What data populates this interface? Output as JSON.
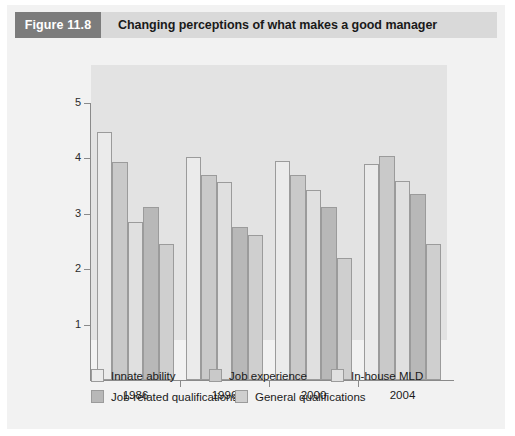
{
  "figure": {
    "number": "Figure 11.8",
    "title": "Changing perceptions of what makes a good manager"
  },
  "colors": {
    "figure_number_bg": "#7c7c7c",
    "figure_title_bg": "#d9d9d9",
    "card_bg": "#f2f2f2",
    "plot_bg": "#e3e3e3",
    "axis": "#8a8a8a",
    "series": [
      "#ebebeb",
      "#c9c9c9",
      "#e0e0e0",
      "#b8b8b8",
      "#cfcfcf"
    ]
  },
  "chart_data": {
    "type": "bar",
    "title": "Changing perceptions of what makes a good manager",
    "xlabel": "",
    "ylabel": "",
    "ylim": [
      0,
      5
    ],
    "yticks": [
      1,
      2,
      3,
      4,
      5
    ],
    "grid": false,
    "legend_position": "bottom",
    "categories": [
      "1986",
      "1996",
      "2000",
      "2004"
    ],
    "series": [
      {
        "name": "Innate ability",
        "color": "#ebebeb",
        "values": [
          4.48,
          4.03,
          3.95,
          3.9
        ]
      },
      {
        "name": "Job experience",
        "color": "#c9c9c9",
        "values": [
          3.93,
          3.7,
          3.7,
          4.05
        ]
      },
      {
        "name": "In-house MLD",
        "color": "#e0e0e0",
        "values": [
          2.85,
          3.58,
          3.43,
          3.6
        ]
      },
      {
        "name": "Job-related qualifications",
        "color": "#b8b8b8",
        "values": [
          3.13,
          2.77,
          3.12,
          3.35
        ]
      },
      {
        "name": "General qualifications",
        "color": "#cfcfcf",
        "values": [
          2.45,
          2.62,
          2.2,
          2.45
        ]
      }
    ]
  }
}
